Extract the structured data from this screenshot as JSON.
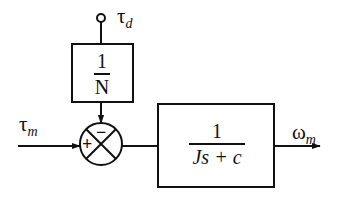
{
  "diagram": {
    "type": "block-diagram",
    "inputs": {
      "disturbance": {
        "symbol": "τ",
        "subscript": "d"
      },
      "motor_torque": {
        "symbol": "τ",
        "subscript": "m"
      }
    },
    "output": {
      "symbol": "ω",
      "subscript": "m"
    },
    "blocks": [
      {
        "id": "gear-ratio",
        "numerator": "1",
        "denominator": "N"
      },
      {
        "id": "plant",
        "numerator": "1",
        "denominator": "Js + c"
      }
    ],
    "summing_junction": {
      "plus_sign": "+",
      "minus_sign": "−"
    },
    "colors": {
      "stroke": "#111111",
      "background": "#ffffff"
    }
  }
}
